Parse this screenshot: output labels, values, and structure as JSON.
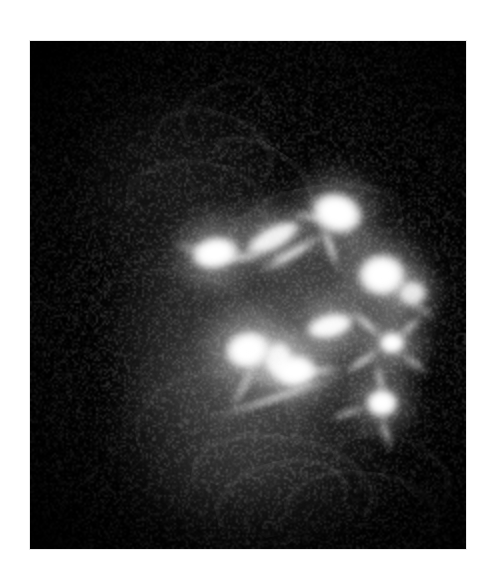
{
  "page": {
    "background_color": "#ffffff",
    "width": 493,
    "height": 582,
    "caption": "",
    "alt_text": "Grayscale fluorescence micrograph of labeled cells"
  },
  "panel": {
    "name": "micrograph-panel",
    "background_color": "#000000",
    "left": 30,
    "top": 41,
    "width": 436,
    "height": 508,
    "border_color": "#e9e9e9"
  },
  "image_meta": {
    "modality": "fluorescence-microscopy",
    "channel": "grayscale",
    "signal_color": "#ffffff",
    "background_color": "#000000",
    "visible_text": ""
  },
  "features": {
    "description": "bright cell somata with radiating processes over a dark field",
    "soma_count": 9,
    "diffuse_glow_regions": 3,
    "filament_regions": 4
  },
  "chart_data": {
    "type": "heatmap",
    "title": "",
    "xlabel": "",
    "ylabel": "",
    "grid": false,
    "legend": "none",
    "xlim": [
      0,
      436
    ],
    "ylim": [
      0,
      508
    ],
    "colormap": "gray",
    "vmin": 0,
    "vmax": 255,
    "note": "Intensity field reconstructed as positioned luminous blobs; coordinates are panel-local pixels.",
    "diffuse_fields": [
      {
        "name": "central-haze",
        "x": 228,
        "y": 280,
        "rx": 150,
        "ry": 125,
        "intensity": 60,
        "rot": -22
      },
      {
        "name": "lower-haze",
        "x": 215,
        "y": 370,
        "rx": 140,
        "ry": 95,
        "intensity": 44,
        "rot": -18
      },
      {
        "name": "upper-left-haze",
        "x": 150,
        "y": 150,
        "rx": 105,
        "ry": 100,
        "intensity": 22,
        "rot": 0
      },
      {
        "name": "right-haze",
        "x": 320,
        "y": 260,
        "rx": 95,
        "ry": 105,
        "intensity": 38,
        "rot": 0
      },
      {
        "name": "bottom-haze",
        "x": 240,
        "y": 440,
        "rx": 135,
        "ry": 70,
        "intensity": 26,
        "rot": -8
      }
    ],
    "somata": [
      {
        "name": "soma-upper-right-triangle",
        "x": 307,
        "y": 172,
        "rx": 26,
        "ry": 20,
        "intensity": 255,
        "rot": 18,
        "halo": 52
      },
      {
        "name": "soma-mid-left-bright",
        "x": 185,
        "y": 212,
        "rx": 24,
        "ry": 16,
        "intensity": 255,
        "rot": -10,
        "halo": 48
      },
      {
        "name": "soma-upper-mid-streak",
        "x": 243,
        "y": 197,
        "rx": 30,
        "ry": 11,
        "intensity": 240,
        "rot": -28,
        "halo": 40
      },
      {
        "name": "soma-right-upper-round",
        "x": 352,
        "y": 234,
        "rx": 24,
        "ry": 21,
        "intensity": 255,
        "rot": 0,
        "halo": 50
      },
      {
        "name": "soma-right-small",
        "x": 382,
        "y": 252,
        "rx": 14,
        "ry": 12,
        "intensity": 230,
        "rot": 0,
        "halo": 32
      },
      {
        "name": "soma-star-center",
        "x": 362,
        "y": 302,
        "rx": 13,
        "ry": 11,
        "intensity": 255,
        "rot": 0,
        "halo": 44
      },
      {
        "name": "soma-mid-bar",
        "x": 300,
        "y": 285,
        "rx": 24,
        "ry": 12,
        "intensity": 250,
        "rot": -14,
        "halo": 38
      },
      {
        "name": "soma-center-cluster-a",
        "x": 218,
        "y": 309,
        "rx": 23,
        "ry": 19,
        "intensity": 255,
        "rot": -12,
        "halo": 54
      },
      {
        "name": "soma-center-cluster-b",
        "x": 248,
        "y": 318,
        "rx": 14,
        "ry": 17,
        "intensity": 245,
        "rot": 8,
        "halo": 36
      },
      {
        "name": "soma-center-cluster-c",
        "x": 265,
        "y": 330,
        "rx": 22,
        "ry": 16,
        "intensity": 255,
        "rot": -6,
        "halo": 44
      },
      {
        "name": "soma-lower-right",
        "x": 352,
        "y": 362,
        "rx": 16,
        "ry": 14,
        "intensity": 255,
        "rot": 0,
        "halo": 42
      }
    ],
    "processes": [
      {
        "name": "process-ur-down",
        "x": 300,
        "y": 205,
        "len": 54,
        "w": 7,
        "rot": 70,
        "intensity": 170
      },
      {
        "name": "process-ur-left",
        "x": 280,
        "y": 176,
        "len": 46,
        "w": 6,
        "rot": 8,
        "intensity": 150
      },
      {
        "name": "process-ml-right",
        "x": 212,
        "y": 216,
        "len": 48,
        "w": 8,
        "rot": -4,
        "intensity": 160
      },
      {
        "name": "process-ml-left",
        "x": 160,
        "y": 206,
        "len": 40,
        "w": 5,
        "rot": 14,
        "intensity": 120
      },
      {
        "name": "process-mid-diag",
        "x": 262,
        "y": 212,
        "len": 78,
        "w": 9,
        "rot": -30,
        "intensity": 185
      },
      {
        "name": "process-star-nw",
        "x": 336,
        "y": 282,
        "len": 46,
        "w": 7,
        "rot": 40,
        "intensity": 175
      },
      {
        "name": "process-star-ne",
        "x": 380,
        "y": 286,
        "len": 40,
        "w": 6,
        "rot": -42,
        "intensity": 160
      },
      {
        "name": "process-star-sw",
        "x": 332,
        "y": 320,
        "len": 48,
        "w": 7,
        "rot": -34,
        "intensity": 170
      },
      {
        "name": "process-star-se",
        "x": 384,
        "y": 322,
        "len": 38,
        "w": 6,
        "rot": 38,
        "intensity": 150
      },
      {
        "name": "process-lr-up",
        "x": 350,
        "y": 338,
        "len": 38,
        "w": 6,
        "rot": 78,
        "intensity": 150
      },
      {
        "name": "process-lr-down",
        "x": 356,
        "y": 392,
        "len": 44,
        "w": 6,
        "rot": 72,
        "intensity": 140
      },
      {
        "name": "process-lr-left",
        "x": 318,
        "y": 372,
        "len": 44,
        "w": 6,
        "rot": -16,
        "intensity": 140
      },
      {
        "name": "process-center-long",
        "x": 248,
        "y": 356,
        "len": 150,
        "w": 6,
        "rot": -18,
        "intensity": 165
      },
      {
        "name": "process-center-down",
        "x": 214,
        "y": 344,
        "len": 60,
        "w": 7,
        "rot": -62,
        "intensity": 130
      },
      {
        "name": "process-cluster-rt",
        "x": 288,
        "y": 330,
        "len": 56,
        "w": 7,
        "rot": -8,
        "intensity": 150
      },
      {
        "name": "process-right-tail",
        "x": 392,
        "y": 268,
        "len": 40,
        "w": 5,
        "rot": 34,
        "intensity": 120
      }
    ],
    "filaments": [
      {
        "name": "filament-upper-arc-1",
        "x": 120,
        "y": 70,
        "w": 120,
        "h": 80,
        "rot": 18,
        "intensity": 42,
        "thickness": 2
      },
      {
        "name": "filament-upper-arc-2",
        "x": 150,
        "y": 40,
        "w": 90,
        "h": 70,
        "rot": -24,
        "intensity": 38,
        "thickness": 2
      },
      {
        "name": "filament-upper-arc-3",
        "x": 95,
        "y": 120,
        "w": 140,
        "h": 90,
        "rot": 8,
        "intensity": 34,
        "thickness": 2
      },
      {
        "name": "filament-upper-arc-4",
        "x": 175,
        "y": 105,
        "w": 110,
        "h": 60,
        "rot": 32,
        "intensity": 46,
        "thickness": 2
      },
      {
        "name": "filament-mid-arc-1",
        "x": 200,
        "y": 145,
        "w": 170,
        "h": 80,
        "rot": -10,
        "intensity": 40,
        "thickness": 2
      },
      {
        "name": "filament-left-sweep",
        "x": 55,
        "y": 230,
        "w": 180,
        "h": 120,
        "rot": 14,
        "intensity": 26,
        "thickness": 2
      },
      {
        "name": "filament-lower-arc-1",
        "x": 105,
        "y": 330,
        "w": 160,
        "h": 110,
        "rot": -6,
        "intensity": 36,
        "thickness": 2
      },
      {
        "name": "filament-lower-arc-2",
        "x": 160,
        "y": 395,
        "w": 180,
        "h": 100,
        "rot": 10,
        "intensity": 40,
        "thickness": 2
      },
      {
        "name": "filament-bottom-loop-1",
        "x": 185,
        "y": 420,
        "w": 130,
        "h": 80,
        "rot": -14,
        "intensity": 48,
        "thickness": 2
      },
      {
        "name": "filament-bottom-loop-2",
        "x": 255,
        "y": 430,
        "w": 150,
        "h": 85,
        "rot": 6,
        "intensity": 44,
        "thickness": 2
      },
      {
        "name": "filament-bottom-loop-3",
        "x": 300,
        "y": 395,
        "w": 120,
        "h": 70,
        "rot": 22,
        "intensity": 38,
        "thickness": 2
      }
    ]
  }
}
